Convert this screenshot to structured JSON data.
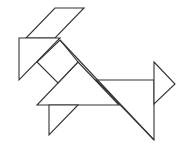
{
  "diagram": {
    "type": "tangram-figure",
    "background": "#ffffff",
    "stroke_color": "#333333",
    "pieces": [
      {
        "name": "parallelogram",
        "points": "55,8 84,8 55,38 26,38"
      },
      {
        "name": "left-triangle",
        "points": "19,38 60,38 19,80"
      },
      {
        "name": "square",
        "points": "60,40 78,62 58,83 37,62"
      },
      {
        "name": "large-triangle",
        "points": "78,62 119,105 37,105"
      },
      {
        "name": "body-triangle",
        "points": "96,80 154,80 154,140"
      },
      {
        "name": "tail-triangle",
        "points": "154,62 175,84 154,104"
      },
      {
        "name": "leg-triangle",
        "points": "49,105 78,105 49,135"
      }
    ],
    "lines": [
      {
        "name": "hypotenuse-line",
        "x1": 60,
        "y1": 40,
        "x2": 154,
        "y2": 140
      }
    ]
  }
}
